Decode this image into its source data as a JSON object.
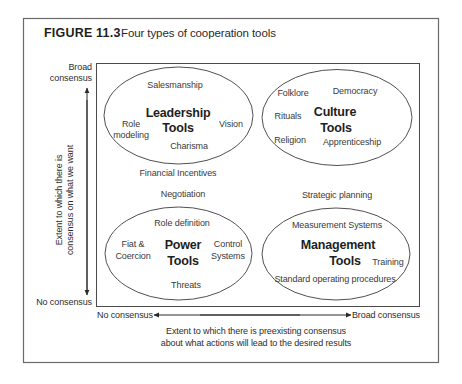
{
  "figure": {
    "label": "FIGURE 11.3",
    "caption": "Four types of cooperation tools"
  },
  "y_axis": {
    "top_label_line1": "Broad",
    "top_label_line2": "consensus",
    "bottom_label": "No consensus",
    "title_line1": "Extent to which there is",
    "title_line2": "consensus on what we want"
  },
  "x_axis": {
    "left_label": "No consensus",
    "right_label": "Broad consensus",
    "title_line1": "Extent to which there is preexisting consensus",
    "title_line2": "about what actions will lead to the desired results"
  },
  "clusters": {
    "leadership": {
      "title_line1": "Leadership",
      "title_line2": "Tools",
      "items": [
        "Salesmanship",
        "Role",
        "modeling",
        "Vision",
        "Charisma"
      ]
    },
    "culture": {
      "title_line1": "Culture",
      "title_line2": "Tools",
      "items": [
        "Folklore",
        "Democracy",
        "Rituals",
        "Religion",
        "Apprenticeship"
      ]
    },
    "power": {
      "title_line1": "Power",
      "title_line2": "Tools",
      "items": [
        "Role definition",
        "Fiat &",
        "Coercion",
        "Control",
        "Systems",
        "Threats"
      ]
    },
    "management": {
      "title_line1": "Management",
      "title_line2": "Tools",
      "items": [
        "Measurement Systems",
        "Training",
        "Standard operating procedures"
      ]
    }
  },
  "between_items": {
    "financial_incentives": "Financial Incentives",
    "negotiation": "Negotiation",
    "strategic_planning": "Strategic planning"
  }
}
